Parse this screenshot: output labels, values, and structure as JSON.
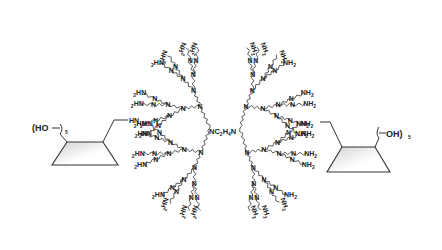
{
  "diagram": {
    "title": "",
    "type": "chemical-structure",
    "core": {
      "label": "NC2H4N",
      "text_parts": [
        "NC",
        "2",
        "H",
        "4",
        "N"
      ]
    },
    "left_cyclodextrin": {
      "label_prefix": "(HO",
      "label_suffix": ")",
      "subscript": "5",
      "linker_label": "HN"
    },
    "right_cyclodextrin": {
      "label_prefix": "(",
      "label_main": "OH",
      "label_suffix": ")",
      "subscript": "5",
      "linker_label": "NH"
    },
    "branch_labels": {
      "internal_node": "N",
      "left_terminal": "HN",
      "left_terminal_sub": "2",
      "right_terminal": "NH",
      "right_terminal_sub": "2"
    },
    "colors": {
      "ink": "#222222",
      "ring_fill_dark": "#cfcfcf",
      "ring_fill_light": "#ffffff",
      "background": "#ffffff"
    }
  }
}
